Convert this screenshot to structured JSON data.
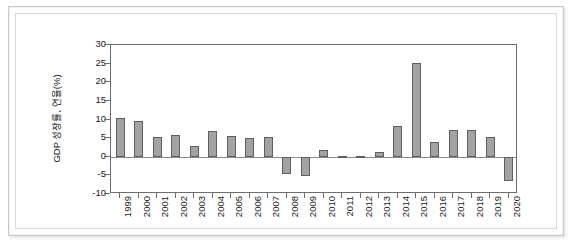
{
  "chart_data": {
    "type": "bar",
    "title": "",
    "subtitle": "",
    "xlabel": "",
    "ylabel": "GDP 성장률, 연율(%)",
    "ylim": [
      -10,
      30
    ],
    "ytick_values": [
      30,
      25,
      20,
      15,
      10,
      5,
      0,
      -5,
      -10
    ],
    "ytick_labels": [
      "30",
      "25",
      "20",
      "15",
      "10",
      "5",
      "0",
      "-5",
      "-10"
    ],
    "grid": false,
    "legend": false,
    "legend_position": "none",
    "zero_line": true,
    "bar_color": "#a3a3a3",
    "bar_edge_color": "#5f5f5f",
    "axis_color": "#6d6d6d",
    "categories": [
      "1999",
      "2000",
      "2001",
      "2002",
      "2003",
      "2004",
      "2005",
      "2006",
      "2007",
      "2008",
      "2009",
      "2010",
      "2011",
      "2012",
      "2013",
      "2014",
      "2015",
      "2016",
      "2017",
      "2018",
      "2019",
      "2020"
    ],
    "values": [
      10.5,
      9.5,
      5.2,
      5.9,
      3.0,
      6.8,
      5.7,
      5.0,
      5.2,
      -4.7,
      -5.3,
      1.7,
      0.3,
      0.3,
      1.3,
      8.3,
      25.3,
      3.9,
      7.3,
      7.3,
      5.4,
      -6.6
    ],
    "series": [
      {
        "name": "GDP 성장률, 연율(%)",
        "values": [
          10.5,
          9.5,
          5.2,
          5.9,
          3.0,
          6.8,
          5.7,
          5.0,
          5.2,
          -4.7,
          -5.3,
          1.7,
          0.3,
          0.3,
          1.3,
          8.3,
          25.3,
          3.9,
          7.3,
          7.3,
          5.4,
          -6.6
        ]
      }
    ]
  }
}
